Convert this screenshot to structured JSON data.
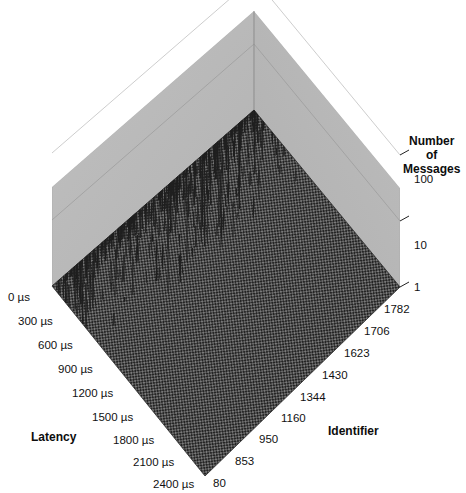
{
  "caption": {
    "text": "differ from the average values."
  },
  "chart_data": {
    "type": "bar",
    "subtype": "3d-surface-spike",
    "title": "",
    "xlabel": "Latency",
    "ylabel": "Identifier",
    "zlabel": "Number of Messages",
    "grid": true,
    "legend": "none",
    "projection": "3d-isometric",
    "z_scale": "log",
    "zlim": [
      1,
      100
    ],
    "z_ticks": [
      "1",
      "10",
      "100"
    ],
    "z_tick_values": [
      1,
      10,
      100
    ],
    "x_axis": {
      "name": "Latency",
      "unit": "µs",
      "ticks": [
        "0 µs",
        "300 µs",
        "600 µs",
        "900 µs",
        "1200 µs",
        "1500 µs",
        "1800 µs",
        "2100 µs",
        "2400 µs"
      ],
      "tick_values": [
        0,
        300,
        600,
        900,
        1200,
        1500,
        1800,
        2100,
        2400
      ],
      "range": [
        0,
        2400
      ]
    },
    "y_axis": {
      "name": "Identifier",
      "ticks": [
        "80",
        "853",
        "950",
        "1160",
        "1344",
        "1430",
        "1623",
        "1706",
        "1782"
      ],
      "tick_values": [
        80,
        853,
        950,
        1160,
        1344,
        1430,
        1623,
        1706,
        1782
      ],
      "range": [
        80,
        1782
      ]
    },
    "colors": {
      "wall": "#b9b9b9",
      "wall_shadow": "#b2b2b2",
      "floor_mesh_dark": "#2b2b2b",
      "floor_mesh_light": "#6e6e6e",
      "spike": "#1f1f1f",
      "gridline": "#8f8f8f",
      "background": "#ffffff",
      "text": "#111111"
    },
    "spike_band": {
      "latency_window_us": [
        0,
        700
      ],
      "peak_count_approx": 100,
      "baseline_count": 1
    }
  },
  "axis_titles": {
    "latency": "Latency",
    "identifier": "Identifier",
    "messages_line1": "Number",
    "messages_line2": "of",
    "messages_line3": "Messages"
  }
}
